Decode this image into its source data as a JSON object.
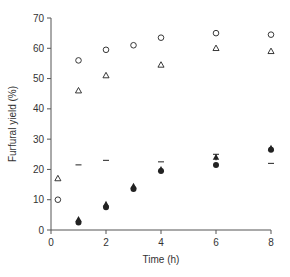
{
  "chart_data": {
    "type": "scatter",
    "title": "",
    "xlabel": "Time (h)",
    "ylabel": "Furfural yield (%)",
    "xlim": [
      0,
      8
    ],
    "ylim": [
      0,
      70
    ],
    "xticks": [
      0,
      2,
      4,
      6,
      8
    ],
    "yticks": [
      0,
      10,
      20,
      30,
      40,
      50,
      60,
      70
    ],
    "grid": false,
    "legend": null,
    "series": [
      {
        "name": "open-circle",
        "marker": "circle-open",
        "points": [
          [
            0.25,
            10
          ],
          [
            1,
            56
          ],
          [
            2,
            59.5
          ],
          [
            3,
            61
          ],
          [
            4,
            63.5
          ],
          [
            6,
            65
          ],
          [
            8,
            64.5
          ]
        ]
      },
      {
        "name": "open-triangle",
        "marker": "triangle-open",
        "points": [
          [
            0.25,
            17
          ],
          [
            1,
            46
          ],
          [
            2,
            51
          ],
          [
            4,
            54.5
          ],
          [
            6,
            60
          ],
          [
            8,
            59
          ]
        ]
      },
      {
        "name": "dash",
        "marker": "dash",
        "points": [
          [
            1,
            21.5
          ],
          [
            2,
            23
          ],
          [
            4,
            22.5
          ],
          [
            8,
            22
          ]
        ]
      },
      {
        "name": "filled-triangle",
        "marker": "triangle-filled",
        "points": [
          [
            1,
            3.5
          ],
          [
            2,
            8.5
          ],
          [
            3,
            14.5
          ],
          [
            4,
            20
          ],
          [
            6,
            24
          ],
          [
            8,
            27
          ]
        ]
      },
      {
        "name": "filled-circle",
        "marker": "circle-filled",
        "points": [
          [
            1,
            2.5
          ],
          [
            2,
            7.5
          ],
          [
            3,
            13.5
          ],
          [
            4,
            19.5
          ],
          [
            6,
            21.5
          ],
          [
            8,
            26.5
          ]
        ]
      }
    ],
    "error_bars": [
      {
        "series": "filled-triangle",
        "x": 6,
        "y": 24,
        "err": 1
      }
    ]
  },
  "colors": {
    "axis": "#555555",
    "marker": "#222222"
  }
}
